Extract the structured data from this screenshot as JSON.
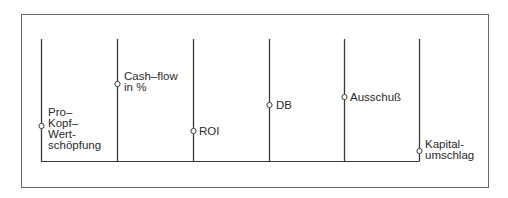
{
  "diagram": {
    "type": "profile-lines",
    "colors": {
      "line": "#3a3a3a",
      "frame": "#6a6a6a",
      "marker_fill": "#ffffff",
      "text": "#2a2a2a"
    },
    "indicators": [
      {
        "id": "pro-kopf",
        "label": "Pro–\nKopf–\nWert-\nschöpfung",
        "x": 41,
        "marker_y": 126
      },
      {
        "id": "cash-flow",
        "label": "Cash–flow\nin %",
        "x": 117,
        "marker_y": 84
      },
      {
        "id": "roi",
        "label": "ROI",
        "x": 193,
        "marker_y": 131
      },
      {
        "id": "db",
        "label": "DB",
        "x": 269,
        "marker_y": 105
      },
      {
        "id": "ausschuss",
        "label": "Ausschuß",
        "x": 344,
        "marker_y": 97
      },
      {
        "id": "kapitalumschlag",
        "label": "Kapital-\numschlag",
        "x": 419,
        "marker_y": 151
      }
    ],
    "line_top_y": 39,
    "baseline_y": 161
  },
  "labels": {
    "pro_kopf": "Pro–\nKopf–\nWert-\nschöpfung",
    "cash_flow": "Cash–flow\nin %",
    "roi": "ROI",
    "db": "DB",
    "ausschuss": "Ausschuß",
    "kapitalumschlag": "Kapital-\numschlag"
  }
}
